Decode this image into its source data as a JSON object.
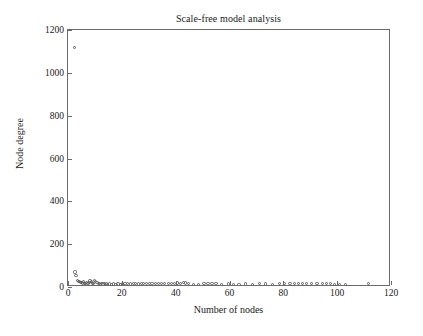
{
  "chart_data": {
    "type": "scatter",
    "title": "Scale-free model analysis",
    "xlabel": "Number of nodes",
    "ylabel": "Node degree",
    "xlim": [
      0,
      120
    ],
    "ylim": [
      0,
      1200
    ],
    "xticks": [
      0,
      20,
      40,
      60,
      80,
      100,
      120
    ],
    "yticks": [
      0,
      200,
      400,
      600,
      800,
      1000,
      1200
    ],
    "xtick_labels": [
      "0",
      "20",
      "40",
      "60",
      "80",
      "100",
      "120"
    ],
    "ytick_labels": [
      "0",
      "200",
      "400",
      "600",
      "800",
      "1000",
      "1200"
    ],
    "grid": false,
    "legend": false,
    "marker": "open-circle",
    "marker_color": "#5a5a5a",
    "series": [
      {
        "name": "node degree",
        "points": [
          [
            2.3,
            1120
          ],
          [
            2.6,
            70
          ],
          [
            3.0,
            55
          ],
          [
            3.4,
            30
          ],
          [
            3.8,
            26
          ],
          [
            4.2,
            24
          ],
          [
            4.6,
            22
          ],
          [
            5.0,
            20
          ],
          [
            5.4,
            19
          ],
          [
            5.8,
            25
          ],
          [
            6.2,
            18
          ],
          [
            6.6,
            17
          ],
          [
            7.0,
            22
          ],
          [
            7.4,
            16
          ],
          [
            7.8,
            20
          ],
          [
            8.2,
            28
          ],
          [
            8.6,
            24
          ],
          [
            9.0,
            18
          ],
          [
            9.4,
            16
          ],
          [
            9.8,
            30
          ],
          [
            10.3,
            26
          ],
          [
            10.8,
            20
          ],
          [
            11.3,
            18
          ],
          [
            11.8,
            16
          ],
          [
            12.4,
            15
          ],
          [
            13.0,
            14
          ],
          [
            13.6,
            16
          ],
          [
            14.2,
            14
          ],
          [
            14.8,
            13
          ],
          [
            15.5,
            14
          ],
          [
            16.2,
            13
          ],
          [
            17.0,
            14
          ],
          [
            17.8,
            13
          ],
          [
            18.6,
            14
          ],
          [
            19.4,
            13
          ],
          [
            20.2,
            14
          ],
          [
            21.2,
            16
          ],
          [
            22.2,
            15
          ],
          [
            23.2,
            14
          ],
          [
            24.2,
            16
          ],
          [
            25.2,
            15
          ],
          [
            26.2,
            14
          ],
          [
            27.2,
            16
          ],
          [
            28.2,
            15
          ],
          [
            29.2,
            18
          ],
          [
            30.2,
            16
          ],
          [
            31.2,
            15
          ],
          [
            32.4,
            17
          ],
          [
            33.6,
            16
          ],
          [
            34.8,
            15
          ],
          [
            36.0,
            17
          ],
          [
            37.2,
            16
          ],
          [
            38.4,
            18
          ],
          [
            39.6,
            17
          ],
          [
            40.8,
            19
          ],
          [
            41.8,
            18
          ],
          [
            42.8,
            20
          ],
          [
            43.8,
            19
          ],
          [
            44.8,
            18
          ],
          [
            46.5,
            12
          ],
          [
            48.5,
            13
          ],
          [
            50.5,
            18
          ],
          [
            52.0,
            17
          ],
          [
            53.5,
            18
          ],
          [
            55.0,
            17
          ],
          [
            57.0,
            12
          ],
          [
            59.5,
            14
          ],
          [
            61.5,
            13
          ],
          [
            63.5,
            12
          ],
          [
            66.0,
            14
          ],
          [
            68.5,
            13
          ],
          [
            71.0,
            16
          ],
          [
            73.5,
            14
          ],
          [
            76.0,
            13
          ],
          [
            78.5,
            16
          ],
          [
            80.5,
            15
          ],
          [
            82.5,
            17
          ],
          [
            84.0,
            16
          ],
          [
            85.5,
            17
          ],
          [
            87.0,
            16
          ],
          [
            88.5,
            15
          ],
          [
            90.5,
            16
          ],
          [
            92.5,
            15
          ],
          [
            94.5,
            16
          ],
          [
            96.0,
            17
          ],
          [
            97.5,
            16
          ],
          [
            99.0,
            10
          ],
          [
            101.0,
            10
          ],
          [
            103.0,
            9
          ],
          [
            111.5,
            16
          ]
        ]
      }
    ]
  }
}
